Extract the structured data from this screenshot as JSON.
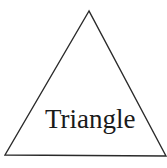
{
  "diagram": {
    "shape": "triangle",
    "label": "Triangle",
    "stroke_color": "#2a2a2a",
    "fill_color": "#ffffff",
    "vertices": [
      [
        89,
        11
      ],
      [
        5,
        155
      ],
      [
        166,
        156
      ]
    ]
  }
}
